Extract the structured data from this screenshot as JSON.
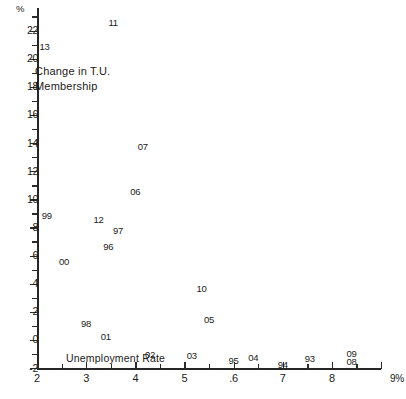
{
  "figure": {
    "y_axis_unit_symbol": "%",
    "x_axis_unit_symbol": "9%",
    "series_label": "Change in T.U.\nMembership",
    "x_axis_title": "Unemployment Rate"
  },
  "chart_data": {
    "type": "scatter",
    "title": "",
    "subtitle": "",
    "xlabel": "Unemployment Rate",
    "ylabel": "Change in T.U. Membership",
    "xunit": "%",
    "yunit": "%",
    "xlim": [
      2,
      9
    ],
    "ylim": [
      -2,
      23
    ],
    "grid": false,
    "legend": null,
    "marker_style": "year-text-label",
    "annotations": [
      "Change in T.U. Membership",
      "Unemployment Rate"
    ],
    "x_ticks": [
      "2",
      "3",
      "4",
      "5",
      ".6",
      "7",
      "8",
      "9%"
    ],
    "x_tick_values": [
      2,
      3,
      4,
      5,
      6,
      7,
      8,
      9
    ],
    "y_ticks": [
      "-2",
      "0",
      "2",
      "4",
      "6",
      "8",
      "10",
      "12",
      "14",
      "16",
      "18",
      "20",
      "22"
    ],
    "y_tick_values": [
      -2,
      0,
      2,
      4,
      6,
      8,
      10,
      12,
      14,
      16,
      18,
      20,
      22
    ],
    "y_minor_tick_values": [
      -1,
      1,
      3,
      5,
      7,
      9,
      11,
      13,
      15,
      17,
      19,
      21,
      23
    ],
    "points": [
      {
        "label": "11",
        "x": 3.55,
        "y": 22.6
      },
      {
        "label": "13",
        "x": 2.15,
        "y": 20.9
      },
      {
        "label": "07",
        "x": 4.15,
        "y": 13.8
      },
      {
        "label": "06",
        "x": 4.0,
        "y": 10.6
      },
      {
        "label": "99",
        "x": 2.2,
        "y": 8.9
      },
      {
        "label": "12",
        "x": 3.25,
        "y": 8.6
      },
      {
        "label": "97",
        "x": 3.65,
        "y": 7.8
      },
      {
        "label": "96",
        "x": 3.45,
        "y": 6.7
      },
      {
        "label": "00",
        "x": 2.55,
        "y": 5.6
      },
      {
        "label": "10",
        "x": 5.35,
        "y": 3.7
      },
      {
        "label": "05",
        "x": 5.5,
        "y": 1.5
      },
      {
        "label": "98",
        "x": 3.0,
        "y": 1.2
      },
      {
        "label": "01",
        "x": 3.4,
        "y": 0.3
      },
      {
        "label": "02",
        "x": 4.3,
        "y": -1.0
      },
      {
        "label": "03",
        "x": 5.15,
        "y": -1.1
      },
      {
        "label": "95",
        "x": 6.0,
        "y": -1.4
      },
      {
        "label": "04",
        "x": 6.4,
        "y": -1.2
      },
      {
        "label": "94",
        "x": 7.0,
        "y": -1.7
      },
      {
        "label": "93",
        "x": 7.55,
        "y": -1.3
      },
      {
        "label": "09",
        "x": 8.4,
        "y": -0.9
      },
      {
        "label": "08",
        "x": 8.4,
        "y": -1.5
      }
    ]
  }
}
